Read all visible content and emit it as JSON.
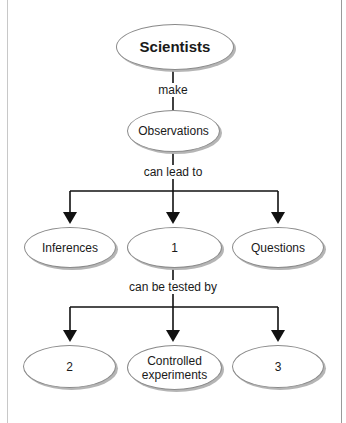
{
  "diagram": {
    "type": "concept-map",
    "colors": {
      "line": "#111111",
      "node_border": "#8a8a8a",
      "node_shadow": "#b5b5b5",
      "background": "#ffffff"
    },
    "nodes": {
      "scientists": "Scientists",
      "observations": "Observations",
      "inferences": "Inferences",
      "blank1": "1",
      "questions": "Questions",
      "blank2": "2",
      "controlled": "Controlled experiments",
      "blank3": "3"
    },
    "links": {
      "make": "make",
      "can_lead_to": "can lead to",
      "can_be_tested_by": "can be tested by"
    }
  }
}
